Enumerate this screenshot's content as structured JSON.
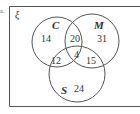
{
  "question_marker": "a.",
  "universal_symbol": "ξ",
  "colors": {
    "stroke": "#555555",
    "text": "#333333",
    "background": "#ffffff"
  },
  "sets": [
    {
      "name": "C",
      "label": "C"
    },
    {
      "name": "M",
      "label": "M"
    },
    {
      "name": "S",
      "label": "S"
    }
  ],
  "regions": {
    "C_only": "14",
    "M_only": "31",
    "S_only": "24",
    "C_and_M_only": "20",
    "C_and_S_only": "12",
    "M_and_S_only": "15",
    "C_M_S": "4"
  }
}
